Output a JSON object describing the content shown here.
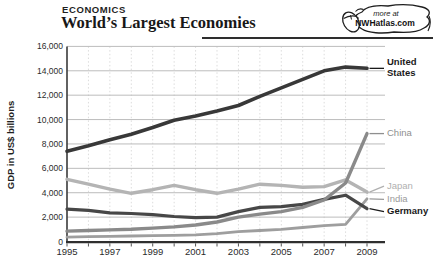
{
  "header": {
    "kicker": "ECONOMICS",
    "title": "World’s Largest Economies"
  },
  "badge": {
    "line1": "more at",
    "line2": "NWHatlas.com",
    "icon": "computer-mouse-icon"
  },
  "chart_data": {
    "type": "line",
    "title": "World’s Largest Economies",
    "xlabel": "",
    "ylabel": "GDP in US$ billions",
    "x": [
      1995,
      1996,
      1997,
      1998,
      1999,
      2000,
      2001,
      2002,
      2003,
      2004,
      2005,
      2006,
      2007,
      2008,
      2009
    ],
    "x_tick_labels": [
      "1995",
      "1997",
      "1999",
      "2001",
      "2003",
      "2005",
      "2007",
      "2009"
    ],
    "x_label_years": [
      1995,
      1997,
      1999,
      2001,
      2003,
      2005,
      2007,
      2009
    ],
    "ylim": [
      0,
      16000
    ],
    "y_ticks": [
      0,
      2000,
      4000,
      6000,
      8000,
      10000,
      12000,
      14000,
      16000
    ],
    "y_tick_labels": [
      "0",
      "2,000",
      "4,000",
      "6,000",
      "8,000",
      "10,000",
      "12,000",
      "14,000",
      "16,000"
    ],
    "grid": "horizontal solid gray, vertical dotted per year",
    "legend_position": "right of line ends",
    "series": [
      {
        "name": "Japan",
        "label": "Japan",
        "color": "#b4b4b4",
        "label_color": "#b0b0b0",
        "label_bold": false,
        "line_width": 3.4,
        "values": [
          5100,
          4700,
          4300,
          3950,
          4250,
          4600,
          4250,
          3950,
          4300,
          4700,
          4600,
          4450,
          4500,
          5050,
          4050
        ]
      },
      {
        "name": "India",
        "label": "India",
        "color": "#9e9e9e",
        "label_color": "#9a9a9a",
        "label_bold": false,
        "line_width": 2.8,
        "values": [
          350,
          400,
          430,
          450,
          480,
          500,
          550,
          650,
          800,
          900,
          1000,
          1150,
          1300,
          1400,
          3500
        ]
      },
      {
        "name": "Germany",
        "label": "Germany",
        "color": "#474747",
        "label_color": "#1a1a1a",
        "label_bold": true,
        "line_width": 3.2,
        "values": [
          2650,
          2550,
          2350,
          2300,
          2200,
          2050,
          1950,
          2000,
          2450,
          2800,
          2850,
          3050,
          3450,
          3800,
          2700
        ]
      },
      {
        "name": "China",
        "label": "China",
        "color": "#8a8a8a",
        "label_color": "#8f8f8f",
        "label_bold": false,
        "line_width": 3.4,
        "values": [
          850,
          900,
          950,
          1000,
          1100,
          1200,
          1350,
          1600,
          2000,
          2250,
          2450,
          2800,
          3400,
          4800,
          8850
        ]
      },
      {
        "name": "United States",
        "label": "United States",
        "color": "#383838",
        "label_color": "#1a1a1a",
        "label_bold": true,
        "line_width": 3.6,
        "values": [
          7400,
          7850,
          8350,
          8800,
          9350,
          9950,
          10300,
          10700,
          11150,
          11900,
          12600,
          13300,
          14000,
          14300,
          14200
        ]
      }
    ]
  }
}
